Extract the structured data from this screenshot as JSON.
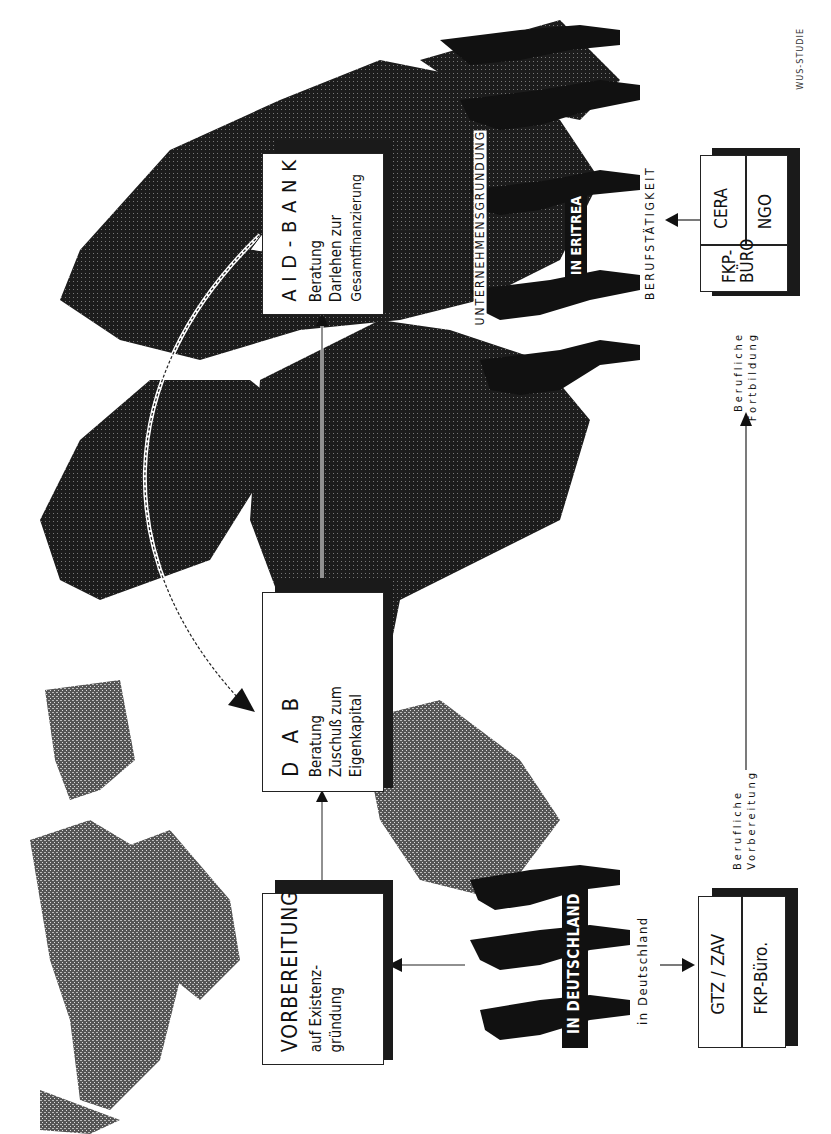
{
  "diagram": {
    "orientation": "rotated-90-ccw",
    "source_label": "WUS-STUDIE",
    "boxes": {
      "vorbereitung": {
        "title": "VORBEREITUNG",
        "lines": [
          "auf Existenz-",
          "gründung"
        ]
      },
      "dab": {
        "title": "D A B",
        "lines": [
          "Beratung",
          "Zuschuß zum",
          "Eigenkapital"
        ]
      },
      "aid_bank": {
        "title": "A I D - B A N K",
        "lines": [
          "Beratung",
          "Darlehen zur",
          "Gesamtfinanzierung"
        ]
      },
      "germany_orgs": {
        "cells": [
          "GTZ / ZAV",
          "FKP-Büro."
        ]
      },
      "eritrea_orgs": {
        "cells": [
          "FKP-BÜRO",
          "CERA",
          "NGO"
        ]
      }
    },
    "labels": {
      "in_deutschland_banner": "IN DEUTSCHLAND",
      "in_deutschland": "in Deutschland",
      "in_eritrea_banner": "IN ERITREA",
      "berufstaetigkeit": "BERUFSTÄTIGKEIT",
      "unternehmensgruendung": "UNTERNEHMENSGRÜNDUNG",
      "berufliche_vorbereitung": [
        "Berufliche",
        "Vorbereitung"
      ],
      "berufliche_fortbildung": [
        "Berufliche",
        "Fortbildung"
      ]
    },
    "colors": {
      "ink": "#111111",
      "paper": "#ffffff",
      "map_dark": "#1c1c1c",
      "map_light": "#5a5a5a"
    }
  }
}
